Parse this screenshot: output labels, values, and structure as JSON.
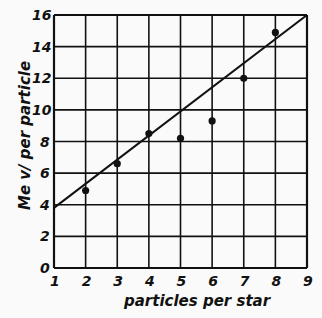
{
  "chart_data": {
    "type": "scatter",
    "title": "",
    "xlabel": "particles per star",
    "ylabel": "Mev per particle",
    "xlim": [
      1,
      9
    ],
    "ylim": [
      0,
      16
    ],
    "grid": true,
    "x_ticks": [
      1,
      2,
      3,
      4,
      5,
      6,
      7,
      8,
      9
    ],
    "y_ticks": [
      0,
      2,
      4,
      6,
      8,
      10,
      12,
      14,
      16
    ],
    "series": [
      {
        "name": "measured",
        "type": "scatter",
        "x": [
          2,
          3,
          4,
          5,
          6,
          7,
          8
        ],
        "y": [
          4.9,
          6.6,
          8.5,
          8.2,
          9.3,
          12.0,
          14.9
        ]
      },
      {
        "name": "fit line",
        "type": "line",
        "x": [
          1,
          9
        ],
        "y": [
          3.8,
          16.0
        ]
      }
    ]
  },
  "labels": {
    "xlabel": "particles per star",
    "ylabel": "Me v/ per particle"
  },
  "colors": {
    "ink": "#111111",
    "paper": "#fafafa"
  }
}
